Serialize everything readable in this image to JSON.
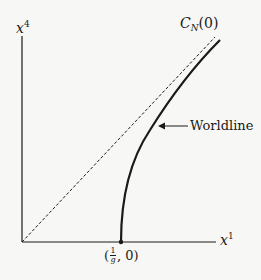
{
  "diagram": {
    "axes": {
      "vertical_label": "x",
      "vertical_superscript": "4",
      "horizontal_label": "x",
      "horizontal_superscript": "1"
    },
    "lightcone": {
      "label_script": "C",
      "label_subscript": "N",
      "label_arg": "(0)",
      "style": "dashed"
    },
    "worldline": {
      "label": "Worldline",
      "start_point_label_num": "1",
      "start_point_label_den": "g",
      "start_point_label_rest": ", 0)",
      "start_point_label_open": "("
    }
  }
}
